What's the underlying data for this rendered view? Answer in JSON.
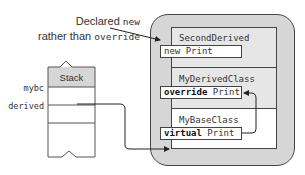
{
  "callout": {
    "line1_text": "Declared ",
    "line1_code": "new",
    "line2_text": "rather than ",
    "line2_code": "override"
  },
  "heap_object": {
    "sections": [
      {
        "class_name": "SecondDerived",
        "method_keyword": "new",
        "method_name": " Print"
      },
      {
        "class_name": "MyDerivedClass",
        "method_keyword": "override",
        "method_name": " Print"
      },
      {
        "class_name": "MyBaseClass",
        "method_keyword": "virtual",
        "method_name": " Print"
      }
    ]
  },
  "stack": {
    "title": "Stack",
    "variables": [
      {
        "name": "mybc"
      },
      {
        "name": "derived"
      }
    ]
  },
  "colors": {
    "heap_fill": "#d6d6d6",
    "outline": "#444444",
    "object_fill": "#ffffff"
  }
}
